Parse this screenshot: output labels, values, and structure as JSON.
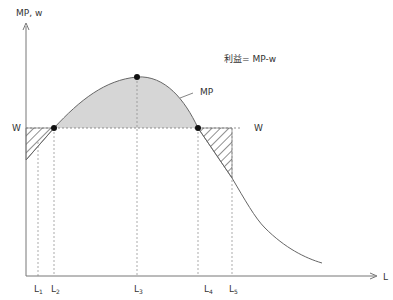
{
  "diagram": {
    "title_annotation": "利益= MP-w",
    "y_axis_label": "MP, w",
    "x_axis_label": "L",
    "curve_label": "MP",
    "wage_label_left": "W",
    "wage_label_right": "W",
    "x_ticks": [
      {
        "base": "L",
        "sub": "1"
      },
      {
        "base": "L",
        "sub": "2"
      },
      {
        "base": "L",
        "sub": "3"
      },
      {
        "base": "L",
        "sub": "4"
      },
      {
        "base": "L",
        "sub": "5"
      }
    ],
    "colors": {
      "profit_fill": "#d6d6d6",
      "line": "#555555",
      "axis": "#777777"
    }
  }
}
